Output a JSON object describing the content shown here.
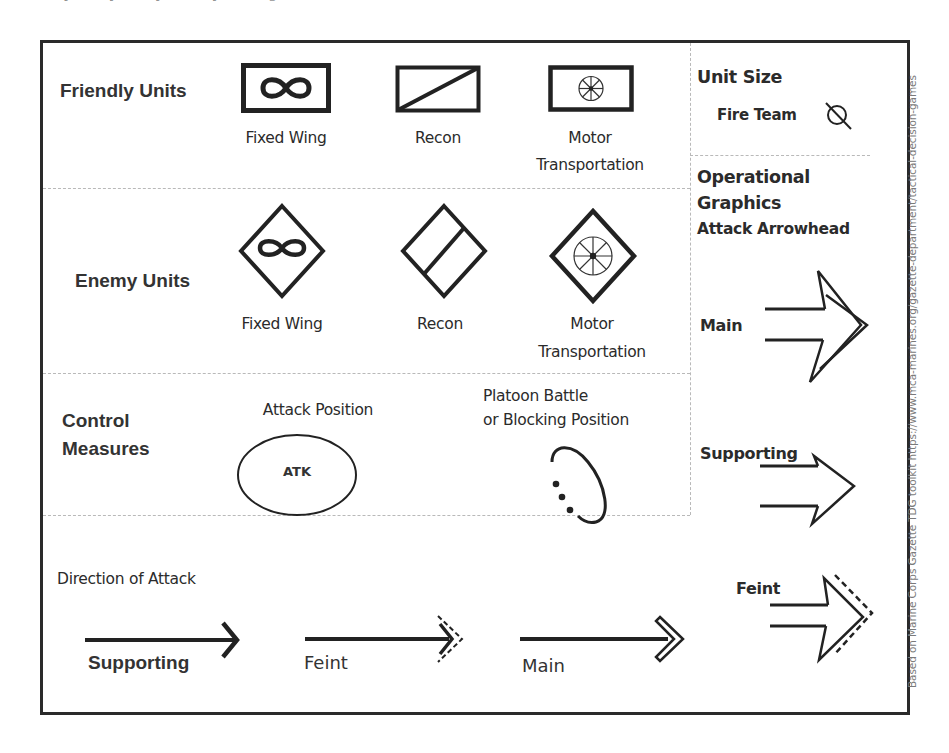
{
  "header_fragment": "...by analytically ... they ... diagram ...",
  "sections": {
    "friendly_units": {
      "title": "Friendly Units",
      "symbols": [
        {
          "label": "Fixed Wing",
          "icon": "infinity-in-rectangle-icon"
        },
        {
          "label": "Recon",
          "icon": "diagonal-slash-rectangle-icon"
        },
        {
          "label_line1": "Motor",
          "label_line2": "Transportation",
          "icon": "wheel-in-rectangle-icon"
        }
      ]
    },
    "enemy_units": {
      "title": "Enemy Units",
      "symbols": [
        {
          "label": "Fixed Wing",
          "icon": "infinity-in-diamond-icon"
        },
        {
          "label": "Recon",
          "icon": "slash-in-diamond-icon"
        },
        {
          "label_line1": "Motor",
          "label_line2": "Transportation",
          "icon": "wheel-in-diamond-icon"
        }
      ]
    },
    "control_measures": {
      "title_line1": "Control",
      "title_line2": "Measures",
      "attack_position": {
        "label": "Attack Position",
        "ellipse_text": "ATK"
      },
      "battle_position": {
        "label_line1": "Platoon Battle",
        "label_line2": "or Blocking Position"
      }
    },
    "direction_of_attack": {
      "title": "Direction of Attack",
      "arrows": [
        {
          "label": "Supporting",
          "icon": "single-chevron-arrow-icon"
        },
        {
          "label": "Feint",
          "icon": "dashed-chevron-arrow-icon"
        },
        {
          "label": "Main",
          "icon": "double-chevron-arrow-icon"
        }
      ]
    },
    "unit_size": {
      "title": "Unit Size",
      "item_label": "Fire Team",
      "icon": "circle-slash-icon"
    },
    "operational_graphics": {
      "title_line1": "Operational",
      "title_line2": "Graphics",
      "subtitle": "Attack Arrowhead",
      "arrowheads": [
        {
          "label": "Main"
        },
        {
          "label": "Supporting"
        },
        {
          "label": "Feint"
        }
      ]
    }
  },
  "credit": "Based on Marine Corps Gazette  TDG toolkit https://www.mca-marines.org/gazette-department/tactical-decision-games",
  "colors": {
    "ink": "#222222",
    "frame": "#2a2a2a",
    "divider": "#b9b9b9",
    "credit_text": "#7a7a7a"
  }
}
